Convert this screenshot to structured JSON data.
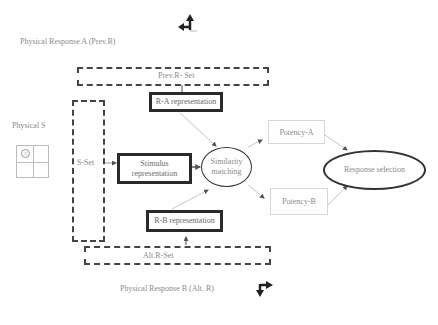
{
  "diagram": {
    "labels": {
      "physical_response_a": "Physical Response A (Prev.R)",
      "physical_response_b": "Physical  Response B (Alt. R)",
      "physical_s": "Physical S"
    },
    "sets": {
      "prev_r_set": "Prev.R- Set",
      "s_set": "S-Set",
      "alt_r_set": "Alt.R-Set"
    },
    "nodes": {
      "r_a_representation": "R-A representation",
      "stimulus_representation_line1": "Stimulus",
      "stimulus_representation_line2": "representation",
      "r_b_representation": "R-B representation",
      "similarity_matching_line1": "Similarity",
      "similarity_matching_line2": "matching",
      "potency_a": "Potency-A",
      "potency_b": "Potency-B",
      "response_selection": "Response selection"
    },
    "icons": {
      "response_a_icon": "arrow-up-left-turn-icon",
      "response_b_icon": "arrow-right-down-turn-icon",
      "stimulus_grid_icon": "grid-with-smiley-icon"
    },
    "colors": {
      "box_border": "#2a2a2a",
      "dashed_border": "#444444",
      "text": "#8a8a8a",
      "thin_border": "#d6d6d6",
      "connector": "#c8c8c8"
    }
  }
}
